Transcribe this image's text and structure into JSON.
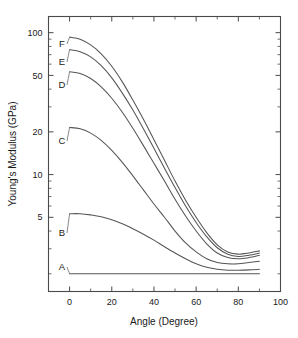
{
  "chart_data": {
    "type": "line",
    "title": "",
    "xlabel": "Angle (Degree)",
    "ylabel": "Young's Modulus (GPa)",
    "xlim": [
      -10,
      100
    ],
    "ylim": [
      1.5,
      130
    ],
    "yscale": "log",
    "xscale": "linear",
    "grid": false,
    "legend_position": "inline-left-labels",
    "xticks": [
      0,
      20,
      40,
      60,
      80,
      100
    ],
    "xtick_labels": [
      "0",
      "20",
      "40",
      "60",
      "80",
      "100"
    ],
    "yticks": [
      5,
      10,
      20,
      50,
      100
    ],
    "ytick_labels": [
      "5",
      "10",
      "20",
      "50",
      "100"
    ],
    "x": [
      0,
      5,
      10,
      15,
      20,
      25,
      30,
      35,
      40,
      45,
      50,
      55,
      60,
      65,
      70,
      75,
      80,
      85,
      90
    ],
    "series": [
      {
        "name": "A",
        "label": "A",
        "values": [
          2.0,
          2.0,
          2.0,
          2.0,
          2.0,
          2.0,
          2.0,
          2.0,
          2.0,
          2.0,
          2.0,
          2.0,
          2.0,
          2.0,
          2.0,
          2.0,
          2.0,
          2.0,
          2.0
        ]
      },
      {
        "name": "B",
        "label": "B",
        "values": [
          5.3,
          5.3,
          5.2,
          5.05,
          4.8,
          4.5,
          4.15,
          3.8,
          3.45,
          3.1,
          2.8,
          2.55,
          2.35,
          2.22,
          2.15,
          2.12,
          2.12,
          2.13,
          2.15
        ]
      },
      {
        "name": "C",
        "label": "C",
        "values": [
          21.5,
          21.0,
          19.6,
          17.4,
          14.8,
          12.2,
          9.8,
          7.8,
          6.2,
          5.0,
          4.0,
          3.3,
          2.85,
          2.55,
          2.4,
          2.35,
          2.35,
          2.4,
          2.45
        ]
      },
      {
        "name": "D",
        "label": "D",
        "values": [
          53.0,
          51.5,
          47.5,
          41.5,
          34.5,
          27.5,
          21.2,
          16.0,
          12.0,
          9.0,
          6.7,
          5.1,
          4.0,
          3.25,
          2.8,
          2.6,
          2.55,
          2.6,
          2.7
        ]
      },
      {
        "name": "E",
        "label": "E",
        "values": [
          76.0,
          73.5,
          67.5,
          58.5,
          48.0,
          37.5,
          28.5,
          21.0,
          15.3,
          11.1,
          8.1,
          6.0,
          4.6,
          3.65,
          3.05,
          2.75,
          2.65,
          2.7,
          2.8
        ]
      },
      {
        "name": "F",
        "label": "F",
        "values": [
          93.0,
          90.0,
          82.0,
          71.0,
          58.0,
          45.0,
          33.5,
          24.5,
          17.6,
          12.6,
          9.0,
          6.6,
          5.0,
          3.9,
          3.2,
          2.85,
          2.75,
          2.8,
          2.9
        ]
      }
    ],
    "curve_labels": [
      {
        "text": "A",
        "x_px": 62,
        "y_px": 267
      },
      {
        "text": "B",
        "x_px": 62,
        "y_px": 233
      },
      {
        "text": "C",
        "x_px": 62,
        "y_px": 141
      },
      {
        "text": "D",
        "x_px": 62,
        "y_px": 85
      },
      {
        "text": "E",
        "x_px": 62,
        "y_px": 62
      },
      {
        "text": "F",
        "x_px": 62,
        "y_px": 44
      }
    ],
    "colors": {
      "curve": "#555555",
      "axis": "#4a4a4a",
      "text": "#1a1a1a",
      "background": "#ffffff"
    }
  }
}
